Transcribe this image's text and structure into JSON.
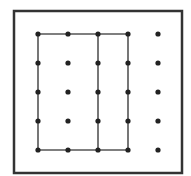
{
  "diagram": {
    "type": "geoboard",
    "grid": {
      "rows": 5,
      "cols": 5,
      "x": [
        38,
        68,
        98,
        128,
        158
      ],
      "y": [
        34,
        63,
        92,
        121,
        150
      ]
    },
    "frame": {
      "x": 14,
      "y": 11,
      "width": 168,
      "height": 162
    },
    "shapes": [
      {
        "name": "rectangle",
        "vertices": [
          [
            0,
            0
          ],
          [
            3,
            0
          ],
          [
            3,
            4
          ],
          [
            0,
            4
          ]
        ]
      },
      {
        "name": "divider-line",
        "from": [
          2,
          0
        ],
        "to": [
          2,
          4
        ]
      }
    ],
    "colors": {
      "frame": "#333333",
      "line": "#555555",
      "dot": "#222222",
      "background": "#ffffff"
    }
  }
}
